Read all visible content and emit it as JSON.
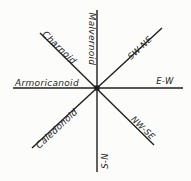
{
  "figure": {
    "trends": [
      {
        "name": "Malvernoid",
        "direction": "S-N"
      },
      {
        "name": "Armoricanoid",
        "direction": "E-W"
      },
      {
        "name": "Charnoid",
        "direction": "NW-SE"
      },
      {
        "name": "Caledonoid",
        "direction": "SW-NE"
      }
    ],
    "colors": {
      "line": "#1f1f1f",
      "text": "#1f1f1f",
      "background": "#fcfcfa"
    }
  }
}
